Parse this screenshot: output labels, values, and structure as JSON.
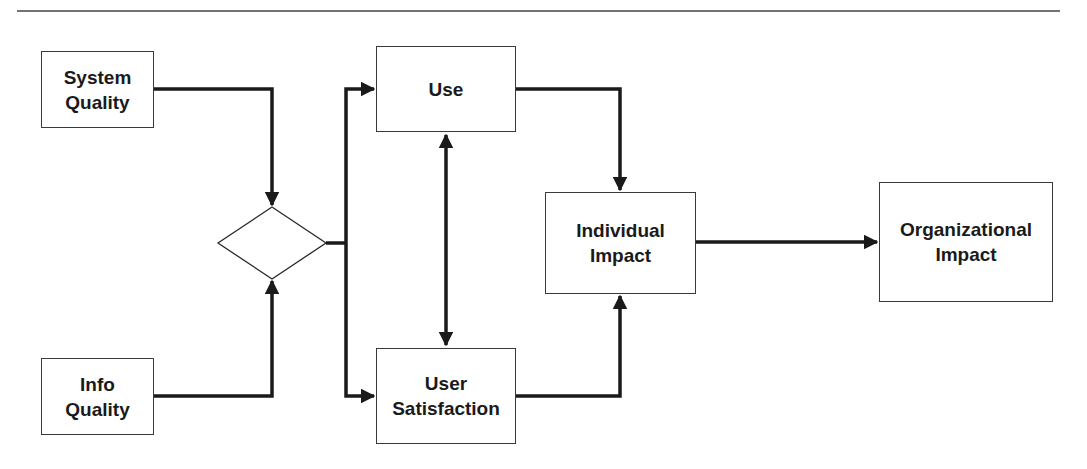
{
  "diagram": {
    "type": "flowchart",
    "colors": {
      "line": "#1a1a1a",
      "box_border": "#3a3a3a",
      "text": "#1a1a1a",
      "background": "#ffffff"
    },
    "nodes": {
      "system_quality": {
        "label": "System\nQuality"
      },
      "info_quality": {
        "label": "Info\nQuality"
      },
      "junction": {
        "label": ""
      },
      "use": {
        "label": "Use"
      },
      "user_satisfaction": {
        "label": "User\nSatisfaction"
      },
      "individual_impact": {
        "label": "Individual\nImpact"
      },
      "organizational_impact": {
        "label": "Organizational\nImpact"
      }
    },
    "edges": [
      {
        "from": "System Quality",
        "to": "junction"
      },
      {
        "from": "Info Quality",
        "to": "junction"
      },
      {
        "from": "junction",
        "to": "Use"
      },
      {
        "from": "junction",
        "to": "User Satisfaction"
      },
      {
        "from": "Use",
        "to": "User Satisfaction",
        "bidirectional": true
      },
      {
        "from": "Use",
        "to": "Individual Impact"
      },
      {
        "from": "User Satisfaction",
        "to": "Individual Impact"
      },
      {
        "from": "Individual Impact",
        "to": "Organizational Impact"
      }
    ]
  }
}
